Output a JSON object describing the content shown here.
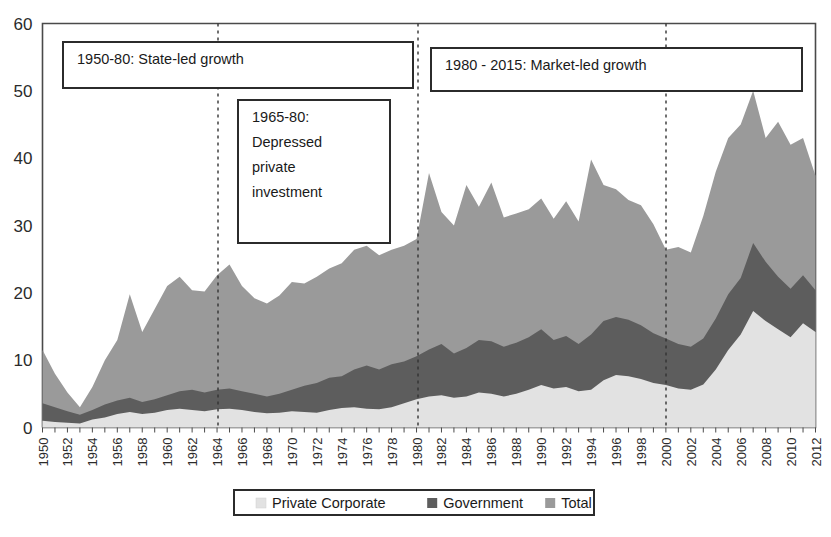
{
  "chart_data": {
    "type": "area",
    "title": "",
    "subtitle": "",
    "xlabel": "",
    "ylabel": "",
    "xlim": [
      1950,
      2013
    ],
    "ylim": [
      0,
      60
    ],
    "grid": false,
    "legend_position": "bottom",
    "y_ticks": [
      "0",
      "10",
      "20",
      "30",
      "40",
      "50",
      "60"
    ],
    "y_tick_values": [
      0,
      10,
      20,
      30,
      40,
      50,
      60
    ],
    "x_tick_labels": [
      "1950",
      "1952",
      "1954",
      "1956",
      "1958",
      "1960",
      "1962",
      "1964",
      "1966",
      "1968",
      "1970",
      "1972",
      "1974",
      "1976",
      "1978",
      "1980",
      "1982",
      "1984",
      "1986",
      "1988",
      "1990",
      "1992",
      "1994",
      "1996",
      "1998",
      "2000",
      "2002",
      "2004",
      "2006",
      "2008",
      "2010",
      "2012"
    ],
    "x": [
      1950,
      1951,
      1952,
      1953,
      1954,
      1955,
      1956,
      1957,
      1958,
      1959,
      1960,
      1961,
      1962,
      1963,
      1964,
      1965,
      1966,
      1967,
      1968,
      1969,
      1970,
      1971,
      1972,
      1973,
      1974,
      1975,
      1976,
      1977,
      1978,
      1979,
      1980,
      1981,
      1982,
      1983,
      1984,
      1985,
      1986,
      1987,
      1988,
      1989,
      1990,
      1991,
      1992,
      1993,
      1994,
      1995,
      1996,
      1997,
      1998,
      1999,
      2000,
      2001,
      2002,
      2003,
      2004,
      2005,
      2006,
      2007,
      2008,
      2009,
      2010,
      2011,
      2012
    ],
    "series": [
      {
        "name": "Private Corporate",
        "color": "#e2e2e2",
        "values": [
          1.0,
          0.8,
          0.7,
          0.6,
          1.2,
          1.5,
          2.0,
          2.3,
          2.0,
          2.2,
          2.6,
          2.8,
          2.6,
          2.4,
          2.7,
          2.8,
          2.6,
          2.3,
          2.1,
          2.2,
          2.4,
          2.3,
          2.2,
          2.6,
          2.9,
          3.0,
          2.8,
          2.7,
          3.0,
          3.6,
          4.2,
          4.6,
          4.8,
          4.4,
          4.6,
          5.2,
          5.0,
          4.6,
          5.0,
          5.6,
          6.3,
          5.8,
          6.0,
          5.4,
          5.6,
          7.0,
          7.8,
          7.6,
          7.2,
          6.6,
          6.3,
          5.8,
          5.6,
          6.4,
          8.6,
          11.5,
          13.8,
          17.3,
          15.8,
          14.6,
          13.4,
          15.5,
          14.2
        ]
      },
      {
        "name": "Government",
        "color": "#5d5d5d",
        "values": [
          3.6,
          3.0,
          2.4,
          1.9,
          2.6,
          3.4,
          4.0,
          4.4,
          3.8,
          4.2,
          4.8,
          5.4,
          5.6,
          5.2,
          5.6,
          5.8,
          5.4,
          5.0,
          4.6,
          5.0,
          5.6,
          6.2,
          6.6,
          7.4,
          7.6,
          8.6,
          9.2,
          8.6,
          9.4,
          9.8,
          10.6,
          11.6,
          12.4,
          11.0,
          11.8,
          13.0,
          12.8,
          12.0,
          12.6,
          13.4,
          14.6,
          13.0,
          13.6,
          12.4,
          13.8,
          15.8,
          16.4,
          16.0,
          15.2,
          14.0,
          13.2,
          12.4,
          12.0,
          13.2,
          16.2,
          19.8,
          22.2,
          27.4,
          24.6,
          22.4,
          20.6,
          22.6,
          20.4
        ]
      },
      {
        "name": "Total",
        "color": "#9a9a9a",
        "values": [
          11.5,
          8.0,
          5.2,
          3.0,
          6.0,
          10.0,
          13.0,
          19.8,
          14.2,
          17.6,
          21.0,
          22.4,
          20.4,
          20.2,
          22.6,
          24.2,
          21.0,
          19.2,
          18.4,
          19.6,
          21.6,
          21.4,
          22.4,
          23.6,
          24.4,
          26.4,
          27.0,
          25.6,
          26.4,
          27.0,
          28.0,
          37.8,
          32.0,
          30.0,
          36.0,
          32.8,
          36.4,
          31.2,
          31.8,
          32.4,
          34.0,
          31.0,
          33.6,
          30.6,
          39.8,
          36.0,
          35.4,
          33.8,
          33.0,
          30.2,
          26.4,
          26.8,
          26.0,
          31.4,
          38.0,
          43.0,
          45.0,
          50.0,
          43.0,
          45.4,
          42.0,
          43.0,
          37.4
        ]
      }
    ],
    "annotations": [
      {
        "id": "state-led-growth",
        "lines": [
          "1950-80: State-led growth"
        ],
        "box": {
          "x": 63,
          "y": 42,
          "width": 350,
          "height": 46
        }
      },
      {
        "id": "depressed-private-investment",
        "lines": [
          "1965-80:",
          "Depressed",
          "private",
          "investment"
        ],
        "box": {
          "x": 238,
          "y": 100,
          "width": 152,
          "height": 143
        }
      },
      {
        "id": "market-led-growth",
        "lines": [
          "1980 - 2015: Market-led growth"
        ],
        "box": {
          "x": 431,
          "y": 48,
          "width": 371,
          "height": 43
        }
      }
    ],
    "vertical_markers": [
      {
        "id": "marker-1965",
        "x_pixel": 218,
        "year": 1965
      },
      {
        "id": "marker-1980",
        "x_pixel": 418,
        "year": 1980
      },
      {
        "id": "marker-2000",
        "x_pixel": 666,
        "year": 2000
      }
    ],
    "legend": [
      {
        "label": "Private Corporate",
        "color": "#e2e2e2"
      },
      {
        "label": "Government",
        "color": "#5d5d5d"
      },
      {
        "label": "Total",
        "color": "#9a9a9a"
      }
    ]
  }
}
